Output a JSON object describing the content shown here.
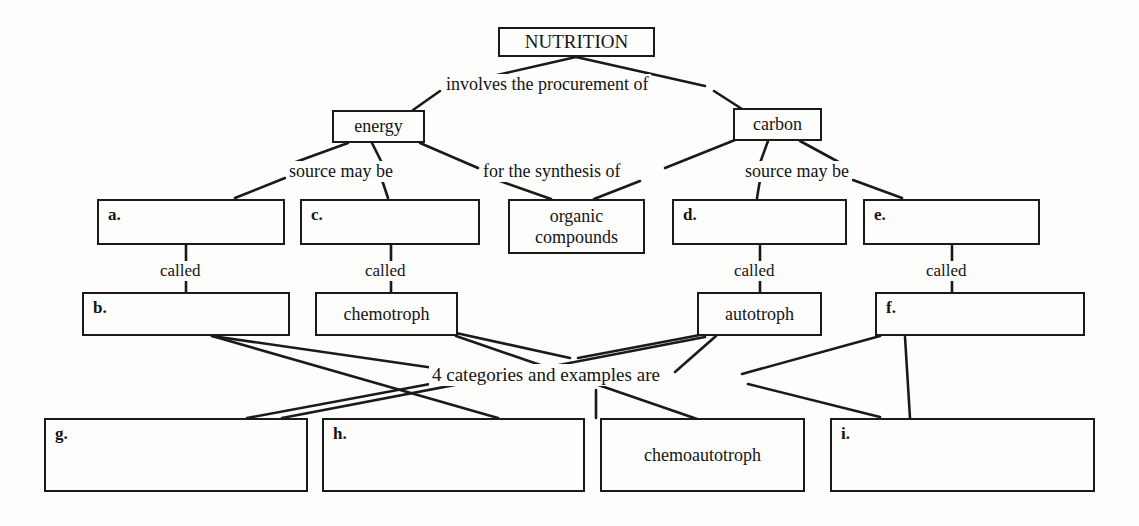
{
  "diagram": {
    "title_node": {
      "label": "NUTRITION"
    },
    "level1": [
      {
        "id": "energy",
        "label": "energy"
      },
      {
        "id": "carbon",
        "label": "carbon"
      }
    ],
    "level2": [
      {
        "id": "a",
        "label": "a."
      },
      {
        "id": "c",
        "label": "c."
      },
      {
        "id": "organic",
        "label": "organic compounds",
        "line1": "organic",
        "line2": "compounds"
      },
      {
        "id": "d",
        "label": "d."
      },
      {
        "id": "e",
        "label": "e."
      }
    ],
    "level3": [
      {
        "id": "b",
        "label": "b."
      },
      {
        "id": "chemotroph",
        "label": "chemotroph"
      },
      {
        "id": "autotroph",
        "label": "autotroph"
      },
      {
        "id": "f",
        "label": "f."
      }
    ],
    "level4": [
      {
        "id": "g",
        "label": "g."
      },
      {
        "id": "h",
        "label": "h."
      },
      {
        "id": "chemoautotroph",
        "label": "chemoautotroph"
      },
      {
        "id": "i",
        "label": "i."
      }
    ],
    "connector_labels": [
      {
        "id": "involves",
        "text": "involves the procurement of"
      },
      {
        "id": "source-may-be-energy",
        "text": "source may be"
      },
      {
        "id": "for-the-synthesis-of",
        "text": "for the synthesis of"
      },
      {
        "id": "source-may-be-carbon",
        "text": "source may be"
      },
      {
        "id": "called-a-b",
        "text": "called"
      },
      {
        "id": "called-c-chemotroph",
        "text": "called"
      },
      {
        "id": "called-d-autotroph",
        "text": "called"
      },
      {
        "id": "called-e-f",
        "text": "called"
      },
      {
        "id": "four-categories",
        "text": "4 categories and examples are"
      }
    ],
    "colors": {
      "ink": "#141414",
      "box_border": "#1a1a1a",
      "background": "#fdfdfc"
    }
  }
}
